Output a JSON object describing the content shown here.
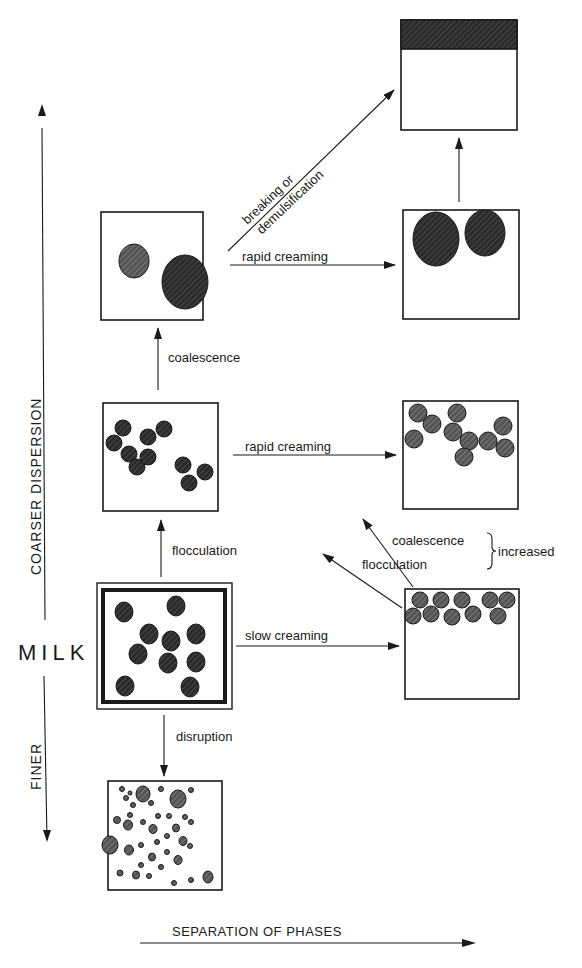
{
  "axes": {
    "vertical_up_label": "COARSER DISPERSION",
    "vertical_down_label": "FINER",
    "center_label": "MILK",
    "horizontal_label": "SEPARATION OF PHASES"
  },
  "transitions": {
    "breaking_line1": "breaking or",
    "breaking_line2": "demulsification",
    "rapid_creaming_top": "rapid creaming",
    "coalescence_up": "coalescence",
    "rapid_creaming_mid": "rapid creaming",
    "flocculation_up": "flocculation",
    "slow_creaming": "slow creaming",
    "disruption": "disruption",
    "increased_coalescence": "coalescence",
    "increased_flocculation": "flocculation",
    "increased": "increased"
  },
  "colors": {
    "ink": "#1a1a1a",
    "droplet_fill": "#4a4a4a",
    "cream_layer": "#2a2a2a",
    "background": "#ffffff"
  },
  "states": [
    {
      "id": "milk",
      "description": "milk emulsion, evenly dispersed droplets"
    },
    {
      "id": "flocculated",
      "description": "flocculated droplet clusters"
    },
    {
      "id": "coalesced",
      "description": "two large coalesced droplets"
    },
    {
      "id": "separated",
      "description": "fully separated oil layer on top"
    },
    {
      "id": "creamed-large",
      "description": "large droplets creamed at top"
    },
    {
      "id": "creamed-flocs",
      "description": "creamed flocs at top"
    },
    {
      "id": "creamed-slow",
      "description": "slowly creamed droplet layer"
    },
    {
      "id": "disrupted",
      "description": "finely disrupted small droplets"
    }
  ]
}
